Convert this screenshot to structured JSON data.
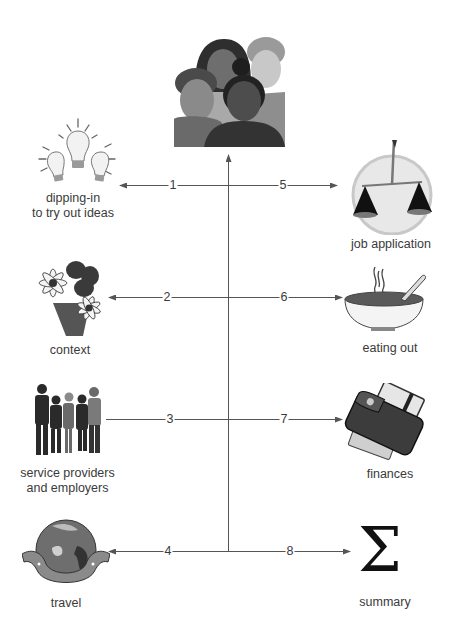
{
  "diagram": {
    "center": {
      "name": "group-of-people",
      "icon": "people-group-icon"
    },
    "connector_color": "#555555",
    "nodes": [
      {
        "number": "1",
        "label_lines": [
          "dipping-in",
          "to try out ideas"
        ],
        "side": "left",
        "icon": "lightbulbs-icon",
        "arrow": true
      },
      {
        "number": "2",
        "label_lines": [
          "context"
        ],
        "side": "left",
        "icon": "flowers-icon",
        "arrow": true
      },
      {
        "number": "3",
        "label_lines": [
          "service providers",
          "and employers"
        ],
        "side": "left",
        "icon": "business-people-icon",
        "arrow": false
      },
      {
        "number": "4",
        "label_lines": [
          "travel"
        ],
        "side": "left",
        "icon": "globe-in-hands-icon",
        "arrow": true
      },
      {
        "number": "5",
        "label_lines": [
          "job application"
        ],
        "side": "right",
        "icon": "balance-scales-icon",
        "arrow": true
      },
      {
        "number": "6",
        "label_lines": [
          "eating out"
        ],
        "side": "right",
        "icon": "soup-bowl-icon",
        "arrow": true
      },
      {
        "number": "7",
        "label_lines": [
          "finances"
        ],
        "side": "right",
        "icon": "wallet-icon",
        "arrow": true
      },
      {
        "number": "8",
        "label_lines": [
          "summary"
        ],
        "side": "right",
        "icon": "sigma-icon",
        "arrow": true
      }
    ],
    "sigma_glyph": "Σ"
  }
}
